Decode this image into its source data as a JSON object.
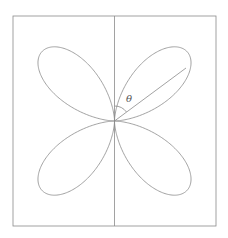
{
  "diagram": {
    "curve": {
      "type": "polar-rose",
      "equation": "r = a·sin(2θ)",
      "petals": 4,
      "stroke": "#8a8a8a"
    },
    "frame": {
      "stroke": "#8a8a8a"
    },
    "axis": {
      "orientation": "vertical",
      "stroke": "#8a8a8a"
    },
    "angle": {
      "label": "θ",
      "from": "vertical axis",
      "to": "radial line to upper-right petal"
    }
  }
}
